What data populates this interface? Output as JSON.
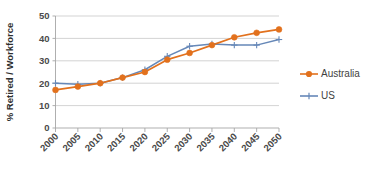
{
  "chart_data": {
    "type": "line",
    "title": "",
    "subtitle": "",
    "xlabel": "",
    "ylabel": "% Retired / Workforce",
    "x": [
      2000,
      2005,
      2010,
      2015,
      2020,
      2025,
      2030,
      2035,
      2040,
      2045,
      2050
    ],
    "categories": [
      "2000",
      "2005",
      "2010",
      "2015",
      "2020",
      "2025",
      "2030",
      "2035",
      "2040",
      "2045",
      "2050"
    ],
    "xtick_labels": [
      "2000",
      "2005",
      "2010",
      "2015",
      "2020",
      "2025",
      "2030",
      "2035",
      "2040",
      "2045",
      "2050"
    ],
    "xtick_rotation_deg": 45,
    "ytick_labels": [
      "0",
      "10",
      "20",
      "30",
      "40",
      "50"
    ],
    "ytick_values": [
      0,
      10,
      20,
      30,
      40,
      50
    ],
    "ylim": [
      0,
      50
    ],
    "xlim": [
      2000,
      2050
    ],
    "grid": "horizontal",
    "legend_position": "right",
    "series": [
      {
        "name": "Australia",
        "color": "#E2711D",
        "marker": "diamond",
        "values": [
          17,
          18.5,
          20,
          22.5,
          25,
          30.5,
          33.5,
          37,
          40.5,
          42.5,
          44
        ]
      },
      {
        "name": "US",
        "color": "#6688B8",
        "marker": "plus",
        "values": [
          20,
          19.5,
          20,
          22.5,
          26,
          32,
          36.5,
          37.5,
          37,
          37,
          39.5
        ]
      }
    ]
  },
  "legend": {
    "entries": [
      {
        "label": "Australia",
        "color": "#E2711D",
        "marker": "diamond"
      },
      {
        "label": "US",
        "color": "#6688B8",
        "marker": "plus"
      }
    ]
  },
  "axes": {
    "y_title": "% Retired / Workforce",
    "y_ticks": [
      "50",
      "40",
      "30",
      "20",
      "10",
      "0"
    ],
    "x_ticks": [
      "2000",
      "2005",
      "2010",
      "2015",
      "2020",
      "2025",
      "2030",
      "2035",
      "2040",
      "2045",
      "2050"
    ]
  },
  "colors": {
    "australia": "#E2711D",
    "us": "#6688B8",
    "gridline": "#c8c8c8",
    "axis": "#a6a6a6",
    "text": "#3f3f3f",
    "background": "#ffffff"
  }
}
